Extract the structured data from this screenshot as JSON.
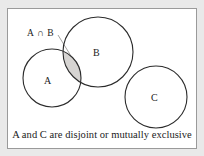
{
  "figure": {
    "kind": "venn-diagram",
    "caption": "A and C are disjoint or mutually exclusive",
    "frame": {
      "background_color": "#ffffff",
      "border_color": "#9a9a9a",
      "page_background_color": "#e9e9e9"
    },
    "sets": [
      {
        "id": "A",
        "label": "A",
        "cx": 44,
        "cy": 69,
        "r": 29,
        "stroke": "#2b2b2b",
        "fill": "none"
      },
      {
        "id": "B",
        "label": "B",
        "cx": 90,
        "cy": 43,
        "r": 35,
        "stroke": "#2b2b2b",
        "fill": "none"
      },
      {
        "id": "C",
        "label": "C",
        "cx": 148,
        "cy": 88,
        "r": 31,
        "stroke": "#2b2b2b",
        "fill": "none"
      }
    ],
    "regions": [
      {
        "id": "A-inter-B",
        "label": "A ∩ B",
        "shaded": true,
        "shade_color": "#d6d4d2",
        "stroke": "#6e6c6a"
      }
    ],
    "annotation": {
      "text": "A ∩ B",
      "leader_line": {
        "from_x": 50,
        "from_y": 26,
        "to_x": 62,
        "to_y": 46,
        "stroke": "#8e8c8a"
      }
    },
    "relations": [
      "A and B overlap (intersection shaded)",
      "A and C are disjoint",
      "B and C are disjoint"
    ]
  }
}
